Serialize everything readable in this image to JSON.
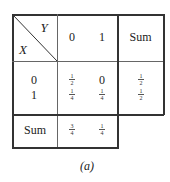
{
  "table": {
    "corner": {
      "row_var": "X",
      "col_var": "Y"
    },
    "col_headers": [
      "0",
      "1"
    ],
    "sum_header": "Sum",
    "rows": [
      {
        "label": "0",
        "cells": [
          {
            "num": "1",
            "den": "2"
          },
          {
            "text": "0"
          }
        ],
        "sum": {
          "num": "1",
          "den": "2"
        }
      },
      {
        "label": "1",
        "cells": [
          {
            "num": "1",
            "den": "4"
          },
          {
            "num": "1",
            "den": "4"
          }
        ],
        "sum": {
          "num": "1",
          "den": "2"
        }
      }
    ],
    "sum_row": {
      "label": "Sum",
      "cells": [
        {
          "num": "3",
          "den": "4"
        },
        {
          "num": "1",
          "den": "4"
        }
      ]
    }
  },
  "caption": "(a)"
}
